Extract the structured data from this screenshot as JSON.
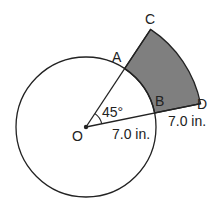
{
  "diagram": {
    "type": "geometry",
    "center": {
      "label": "O"
    },
    "points": {
      "A": "A",
      "B": "B",
      "C": "C",
      "D": "D"
    },
    "angle_label": "45°",
    "radius_label": "7.0 in.",
    "extension_label": "7.0 in.",
    "colors": {
      "stroke": "#222222",
      "shaded_fill": "#7f7f7f",
      "background": "#ffffff"
    }
  }
}
